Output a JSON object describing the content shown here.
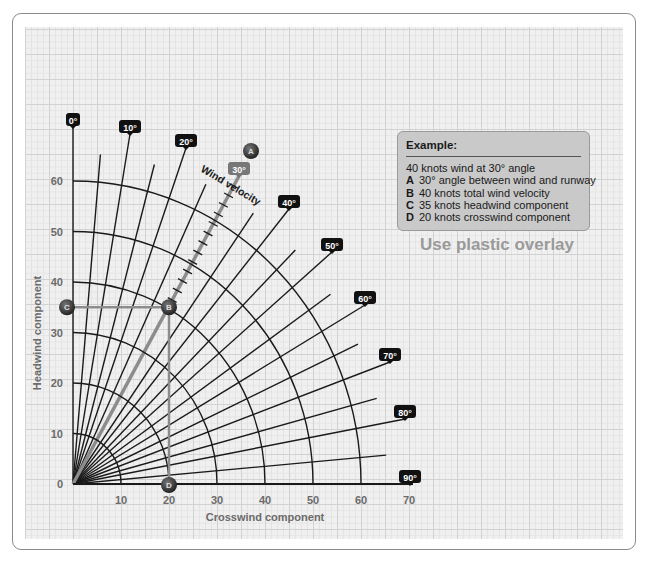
{
  "chart_data": {
    "type": "diagram",
    "xlabel": "Crosswind component",
    "ylabel": "Headwind component",
    "x_ticks": [
      10,
      20,
      30,
      40,
      50,
      60,
      70
    ],
    "y_ticks": [
      0,
      10,
      20,
      30,
      40,
      50,
      60
    ],
    "xlim": [
      0,
      70
    ],
    "ylim": [
      0,
      70
    ],
    "arc_radii": [
      10,
      20,
      30,
      40,
      50,
      60
    ],
    "arc_label": "Wind velocity",
    "angle_labels": [
      "0°",
      "10°",
      "20°",
      "30°",
      "40°",
      "50°",
      "60°",
      "70°",
      "80°",
      "90°"
    ],
    "highlighted_angle": "30°",
    "points": [
      {
        "label": "A",
        "description": "30° angle between wind and runway"
      },
      {
        "label": "B",
        "description": "40 knots total wind velocity",
        "x": 20,
        "y": 35
      },
      {
        "label": "C",
        "description": "35 knots headwind component",
        "x": 0,
        "y": 35
      },
      {
        "label": "D",
        "description": "20 knots crosswind component",
        "x": 20,
        "y": 0
      }
    ]
  },
  "axes": {
    "x_title": "Crosswind component",
    "y_title": "Headwind component",
    "x_ticks": [
      "10",
      "20",
      "30",
      "40",
      "50",
      "60",
      "70"
    ],
    "y_ticks": [
      "0",
      "10",
      "20",
      "30",
      "40",
      "50",
      "60"
    ]
  },
  "wind_velocity_label": "Wind velocity",
  "example": {
    "title": "Example:",
    "summary": "40 knots wind at 30° angle",
    "items": [
      {
        "key": "A",
        "text": "30° angle between wind and runway"
      },
      {
        "key": "B",
        "text": "40 knots total wind velocity"
      },
      {
        "key": "C",
        "text": "35 knots headwind component"
      },
      {
        "key": "D",
        "text": "20 knots crosswind component"
      }
    ]
  },
  "overlay_note": "Use plastic overlay",
  "colors": {
    "line": "#1a1a1a",
    "highlight_line": "#8c8c8c",
    "label_bg": "#111111",
    "highlight_label_bg": "#777777",
    "dot": "#3a3a3a",
    "muted_text": "#6b6b6b"
  }
}
